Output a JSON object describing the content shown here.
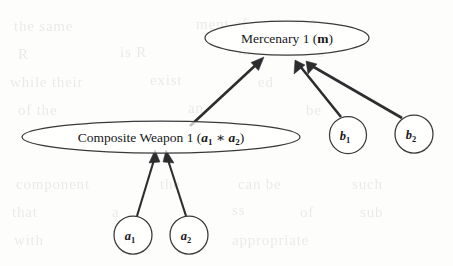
{
  "figure": {
    "kind": "directed-graph-diagram",
    "caption_present": false,
    "background_note": "faint scanned bleed-through text, illegible"
  },
  "nodes": {
    "mercenary": {
      "id": "mercenary-1",
      "shape": "ellipse",
      "label_main": "Mercenary 1 (",
      "label_var": "m",
      "label_close": ")",
      "cx": 287,
      "cy": 38,
      "rx": 82,
      "ry": 17
    },
    "composite_weapon": {
      "id": "composite-weapon-1",
      "shape": "ellipse",
      "label_main": "Composite Weapon 1 (",
      "label_var1": "a",
      "label_sub1": "1",
      "label_op": "∗",
      "label_var2": "a",
      "label_sub2": "2",
      "label_close": ")",
      "cx": 161,
      "cy": 137,
      "rx": 139,
      "ry": 16
    },
    "b1": {
      "id": "b1",
      "shape": "circle",
      "label_var": "b",
      "label_sub": "1",
      "cx": 348,
      "cy": 135,
      "r": 18.5
    },
    "b2": {
      "id": "b2",
      "shape": "circle",
      "label_var": "b",
      "label_sub": "2",
      "cx": 414,
      "cy": 134,
      "r": 19
    },
    "a1": {
      "id": "a1",
      "shape": "circle",
      "label_var": "a",
      "label_sub": "1",
      "cx": 133,
      "cy": 235,
      "r": 19
    },
    "a2": {
      "id": "a2",
      "shape": "circle",
      "label_var": "a",
      "label_sub": "2",
      "cx": 189,
      "cy": 235,
      "r": 19
    }
  },
  "edges": [
    {
      "id": "edge-composite-to-mercenary",
      "from": "composite_weapon",
      "to": "mercenary",
      "arrow": true
    },
    {
      "id": "edge-b1-to-mercenary",
      "from": "b1",
      "to": "mercenary",
      "arrow": true
    },
    {
      "id": "edge-b2-to-mercenary",
      "from": "b2",
      "to": "mercenary",
      "arrow": true
    },
    {
      "id": "edge-a1-to-composite",
      "from": "a1",
      "to": "composite_weapon",
      "arrow": true
    },
    {
      "id": "edge-a2-to-composite",
      "from": "a2",
      "to": "composite_weapon",
      "arrow": true
    }
  ],
  "ghost_text": {
    "lines": [
      {
        "text": "the same",
        "x": 14,
        "y": 18
      },
      {
        "text": "ment of",
        "x": 196,
        "y": 16
      },
      {
        "text": "a",
        "x": 310,
        "y": 14
      },
      {
        "text": "R",
        "x": 18,
        "y": 46
      },
      {
        "text": "is R",
        "x": 120,
        "y": 44
      },
      {
        "text": "in",
        "x": 238,
        "y": 42
      },
      {
        "text": "s",
        "x": 318,
        "y": 44
      },
      {
        "text": "while their",
        "x": 10,
        "y": 74
      },
      {
        "text": "exist",
        "x": 150,
        "y": 72
      },
      {
        "text": "ed",
        "x": 258,
        "y": 74
      },
      {
        "text": "of the",
        "x": 18,
        "y": 102
      },
      {
        "text": "an",
        "x": 188,
        "y": 100
      },
      {
        "text": "be",
        "x": 306,
        "y": 102
      },
      {
        "text": "component",
        "x": 16,
        "y": 176
      },
      {
        "text": "the",
        "x": 160,
        "y": 176
      },
      {
        "text": "can be",
        "x": 238,
        "y": 176
      },
      {
        "text": "such",
        "x": 352,
        "y": 176
      },
      {
        "text": "that",
        "x": 12,
        "y": 204
      },
      {
        "text": "a",
        "x": 112,
        "y": 204
      },
      {
        "text": "ss",
        "x": 232,
        "y": 202
      },
      {
        "text": "of",
        "x": 300,
        "y": 204
      },
      {
        "text": "sub",
        "x": 360,
        "y": 204
      },
      {
        "text": "with",
        "x": 14,
        "y": 232
      },
      {
        "text": "the",
        "x": 118,
        "y": 232
      },
      {
        "text": "appropriate",
        "x": 232,
        "y": 232
      }
    ]
  }
}
